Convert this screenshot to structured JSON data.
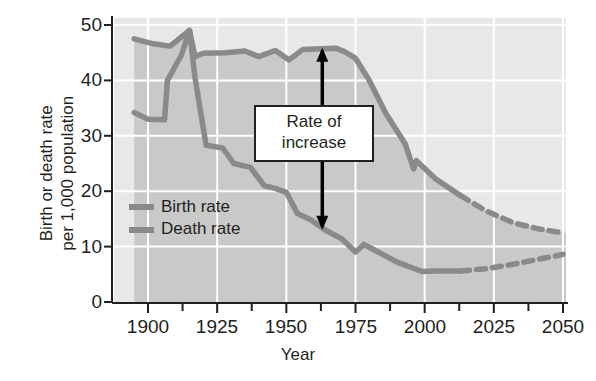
{
  "chart_data": {
    "type": "line",
    "title": "",
    "xlabel": "Year",
    "ylabel": "Birth or death rate per 1,000 population",
    "ylabel_line1": "Birth or death rate",
    "ylabel_line2": "per 1,000 population",
    "xlim": [
      1893,
      2050
    ],
    "ylim": [
      0,
      50
    ],
    "xticks": [
      1900,
      1925,
      1950,
      1975,
      2000,
      2025,
      2050
    ],
    "xtick_labels": [
      "1900",
      "1925",
      "1950",
      "1975",
      "2000",
      "2025",
      "2050"
    ],
    "xminor_ticks": [
      1912.5,
      1937.5,
      1962.5,
      1987.5,
      2012.5,
      2037.5
    ],
    "yticks": [
      0,
      10,
      20,
      30,
      40,
      50
    ],
    "ytick_labels": [
      "0",
      "10",
      "20",
      "30",
      "40",
      "50"
    ],
    "grid": true,
    "legend_position": "inside-left",
    "projection_start_year": 2013,
    "series": [
      {
        "name": "Birth rate",
        "color": "#8a8a8a",
        "solid": [
          {
            "x": 1895,
            "y": 47.5
          },
          {
            "x": 1902,
            "y": 46.6
          },
          {
            "x": 1908,
            "y": 46.2
          },
          {
            "x": 1915,
            "y": 49.0
          },
          {
            "x": 1917,
            "y": 44.3
          },
          {
            "x": 1920,
            "y": 44.9
          },
          {
            "x": 1928,
            "y": 45.0
          },
          {
            "x": 1935,
            "y": 45.3
          },
          {
            "x": 1940,
            "y": 44.3
          },
          {
            "x": 1946,
            "y": 45.4
          },
          {
            "x": 1951,
            "y": 43.7
          },
          {
            "x": 1956,
            "y": 45.6
          },
          {
            "x": 1963,
            "y": 45.7
          },
          {
            "x": 1968,
            "y": 45.8
          },
          {
            "x": 1971,
            "y": 45.2
          },
          {
            "x": 1975,
            "y": 44.0
          },
          {
            "x": 1980,
            "y": 40.0
          },
          {
            "x": 1986,
            "y": 34.0
          },
          {
            "x": 1993,
            "y": 28.5
          },
          {
            "x": 1996,
            "y": 24.0
          },
          {
            "x": 1997,
            "y": 25.5
          },
          {
            "x": 2004,
            "y": 22.2
          },
          {
            "x": 2013,
            "y": 19.2
          }
        ],
        "dashed": [
          {
            "x": 2013,
            "y": 19.2
          },
          {
            "x": 2022,
            "y": 16.5
          },
          {
            "x": 2032,
            "y": 14.3
          },
          {
            "x": 2042,
            "y": 13.1
          },
          {
            "x": 2050,
            "y": 12.5
          }
        ]
      },
      {
        "name": "Death rate",
        "color": "#8a8a8a",
        "solid": [
          {
            "x": 1895,
            "y": 34.2
          },
          {
            "x": 1900,
            "y": 33.0
          },
          {
            "x": 1906,
            "y": 32.9
          },
          {
            "x": 1907,
            "y": 40.0
          },
          {
            "x": 1912,
            "y": 44.5
          },
          {
            "x": 1915,
            "y": 49.0
          },
          {
            "x": 1917,
            "y": 40.5
          },
          {
            "x": 1921,
            "y": 28.3
          },
          {
            "x": 1927,
            "y": 27.8
          },
          {
            "x": 1931,
            "y": 25.0
          },
          {
            "x": 1937,
            "y": 24.3
          },
          {
            "x": 1942,
            "y": 21.0
          },
          {
            "x": 1946,
            "y": 20.5
          },
          {
            "x": 1950,
            "y": 19.8
          },
          {
            "x": 1954,
            "y": 16.0
          },
          {
            "x": 1959,
            "y": 14.8
          },
          {
            "x": 1964,
            "y": 13.0
          },
          {
            "x": 1970,
            "y": 11.4
          },
          {
            "x": 1975,
            "y": 9.0
          },
          {
            "x": 1978,
            "y": 10.4
          },
          {
            "x": 1981,
            "y": 9.6
          },
          {
            "x": 1990,
            "y": 7.2
          },
          {
            "x": 1999,
            "y": 5.5
          },
          {
            "x": 2004,
            "y": 5.6
          },
          {
            "x": 2013,
            "y": 5.6
          }
        ],
        "dashed": [
          {
            "x": 2013,
            "y": 5.6
          },
          {
            "x": 2022,
            "y": 6.0
          },
          {
            "x": 2032,
            "y": 6.8
          },
          {
            "x": 2042,
            "y": 7.8
          },
          {
            "x": 2050,
            "y": 8.6
          }
        ]
      }
    ],
    "annotations": [
      {
        "name": "rate-of-increase",
        "line1": "Rate of",
        "line2": "increase",
        "at_year": 1963,
        "from_value": 45.7,
        "to_value": 13.2,
        "arrow": "double-headed-vertical"
      }
    ],
    "legend": [
      {
        "label": "Birth rate",
        "color": "#8a8a8a"
      },
      {
        "label": "Death rate",
        "color": "#8a8a8a"
      }
    ],
    "colors": {
      "line": "#8a8a8a",
      "plot_upper_band": "#e8e8e8",
      "plot_lower_band": "#c9c9c9",
      "gridline": "#ffffff",
      "axis": "#231f20",
      "text": "#231f20",
      "annotation_box_bg": "#ffffff",
      "annotation_box_border": "#231f20"
    }
  }
}
